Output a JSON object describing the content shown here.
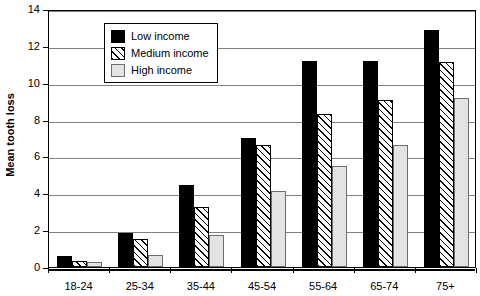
{
  "chart_data": {
    "type": "bar",
    "title": "",
    "subtitle": "",
    "xlabel": "",
    "ylabel": "Mean tooth loss",
    "ylim": [
      0,
      14
    ],
    "ytick_step": 2,
    "yticks": [
      0,
      2,
      4,
      6,
      8,
      10,
      12,
      14
    ],
    "ytick_labels": [
      "0",
      "2",
      "4",
      "6",
      "8",
      "10",
      "12",
      "14"
    ],
    "grid": true,
    "grid_axis": "y",
    "legend_position": "top-left",
    "legend_inside_plot": true,
    "categories": [
      "18-24",
      "25-34",
      "35-44",
      "45-54",
      "55-64",
      "65-74",
      "75+"
    ],
    "series": [
      {
        "name": "Low income",
        "key": "low",
        "fill": "#000000",
        "pattern": "solid",
        "values": [
          0.62,
          1.85,
          4.45,
          7.0,
          11.2,
          11.2,
          12.85
        ]
      },
      {
        "name": "Medium income",
        "key": "medium",
        "fill": "#ffffff",
        "pattern": "diagonal-hatch",
        "values": [
          0.35,
          1.5,
          3.25,
          6.6,
          8.3,
          9.05,
          11.1
        ]
      },
      {
        "name": "High income",
        "key": "high",
        "fill": "#e3e3e3",
        "pattern": "solid",
        "values": [
          0.25,
          0.65,
          1.75,
          4.1,
          5.5,
          6.6,
          9.15
        ]
      }
    ]
  },
  "legend": {
    "items": [
      {
        "label": "Low income",
        "key": "low"
      },
      {
        "label": "Medium income",
        "key": "medium"
      },
      {
        "label": "High income",
        "key": "high"
      }
    ]
  },
  "axes": {
    "y_title": "Mean tooth loss"
  }
}
